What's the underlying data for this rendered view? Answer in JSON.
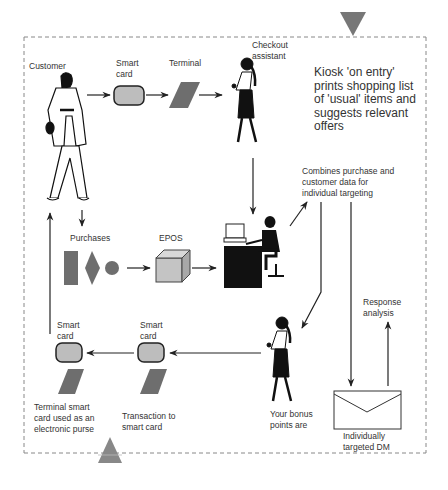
{
  "diagram": {
    "type": "process-flow",
    "colors": {
      "shape_fill": "#707070",
      "card_fill": "#bdbdbd",
      "cube_fill": "#c4c4c4",
      "line": "#222222",
      "border_dash": "#888888",
      "text": "#333333"
    },
    "nodes": {
      "customer": {
        "label": "Customer"
      },
      "smart_card_top": {
        "label": "Smart\ncard"
      },
      "terminal_top": {
        "label": "Terminal"
      },
      "checkout_assistant": {
        "label": "Checkout\nassistant"
      },
      "kiosk": {
        "label": "Kiosk 'on entry'\nprints shopping list\nof 'usual' items and\nsuggests relevant\noffers"
      },
      "purchases": {
        "label": "Purchases"
      },
      "epos": {
        "label": "EPOS"
      },
      "combines": {
        "label": "Combines purchase and\ncustomer data for\nindividual targeting"
      },
      "response_analysis": {
        "label": "Response\nanalysis"
      },
      "smart_card_bottom_left": {
        "label": "Smart\ncard"
      },
      "smart_card_bottom_mid": {
        "label": "Smart\ncard"
      },
      "terminal_purse": {
        "label": "Terminal smart\ncard used as an\nelectronic purse"
      },
      "transaction": {
        "label": "Transaction to\nsmart card"
      },
      "bonus_points": {
        "label": "Your bonus\npoints are"
      },
      "targeted_dm": {
        "label": "Individually\ntargeted DM"
      }
    },
    "edges": [
      {
        "from": "customer",
        "to": "smart_card_top"
      },
      {
        "from": "smart_card_top",
        "to": "terminal_top"
      },
      {
        "from": "terminal_top",
        "to": "checkout_assistant"
      },
      {
        "from": "checkout_assistant",
        "to": "data_operator"
      },
      {
        "from": "customer",
        "to": "purchases"
      },
      {
        "from": "purchases",
        "to": "epos"
      },
      {
        "from": "epos",
        "to": "data_operator"
      },
      {
        "from": "data_operator",
        "to": "combines"
      },
      {
        "from": "combines",
        "to": "bonus_points"
      },
      {
        "from": "combines",
        "to": "targeted_dm"
      },
      {
        "from": "targeted_dm",
        "to": "response_analysis"
      },
      {
        "from": "bonus_points",
        "to": "smart_card_bottom_mid"
      },
      {
        "from": "smart_card_bottom_mid",
        "to": "smart_card_bottom_left"
      },
      {
        "from": "smart_card_bottom_left",
        "to": "customer"
      }
    ]
  }
}
